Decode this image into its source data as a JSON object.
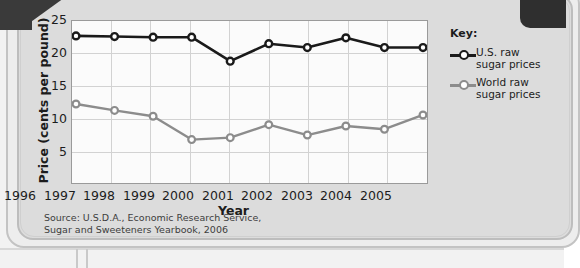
{
  "chart_data": {
    "type": "line",
    "title": "",
    "xlabel": "Year",
    "ylabel": "Price (cents per pound)",
    "categories": [
      "1996",
      "1997",
      "1998",
      "1999",
      "2000",
      "2001",
      "2002",
      "2003",
      "2004",
      "2005"
    ],
    "ylim": [
      0,
      25
    ],
    "yticks": [
      5,
      10,
      15,
      20,
      25
    ],
    "grid": true,
    "legend_position": "right",
    "series": [
      {
        "name": "U.S. raw sugar prices",
        "color": "#1a1a1a",
        "marker": "circle-open",
        "values": [
          22.7,
          22.6,
          22.5,
          22.5,
          18.8,
          21.5,
          20.9,
          22.4,
          20.9,
          20.9
        ]
      },
      {
        "name": "World raw sugar prices",
        "color": "#8c8c8c",
        "marker": "circle-open",
        "values": [
          12.2,
          11.2,
          10.3,
          6.7,
          7.0,
          9.0,
          7.4,
          8.8,
          8.3,
          10.5
        ]
      }
    ],
    "source_note": "Source: U.S.D.A., Economic Research Service, Sugar and Sweeteners Yearbook, 2006"
  },
  "legend": {
    "title": "Key:",
    "entries": [
      {
        "label_line1": "U.S. raw",
        "label_line2": "sugar prices"
      },
      {
        "label_line1": "World raw",
        "label_line2": "sugar prices"
      }
    ]
  },
  "source": {
    "line1": "Source: U.S.D.A., Economic Research Service,",
    "line2": "Sugar and Sweeteners Yearbook, 2006"
  },
  "axes": {
    "y_title": "Price (cents per pound)",
    "x_title": "Year",
    "y_tick_labels": [
      "25",
      "20",
      "15",
      "10",
      "5"
    ],
    "x_tick_labels": [
      "1996",
      "1997",
      "1998",
      "1999",
      "2000",
      "2001",
      "2002",
      "2003",
      "2004",
      "2005"
    ]
  },
  "colors": {
    "us_series": "#1a1a1a",
    "world_series": "#8c8c8c",
    "panel_background": "#dcdcdc",
    "plot_background": "#fbfbfb",
    "gridline": "#d2d2d2"
  }
}
